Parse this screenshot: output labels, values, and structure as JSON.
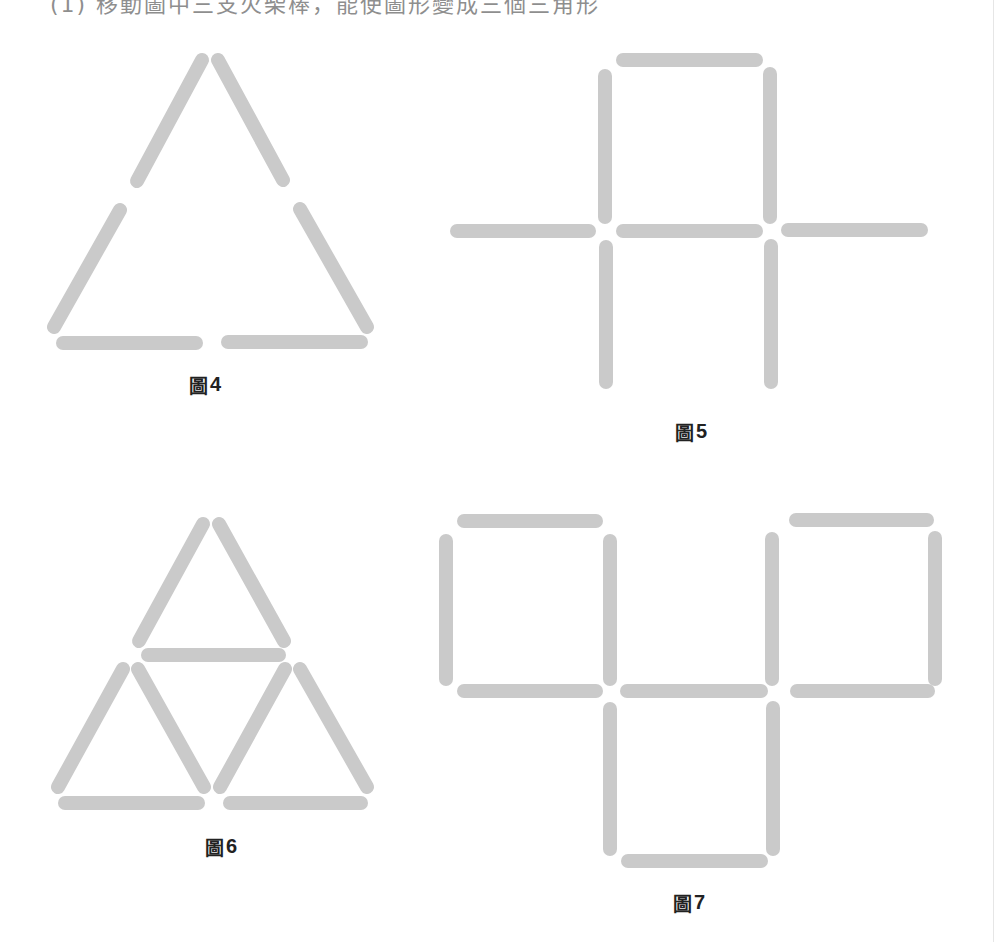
{
  "instruction": {
    "text": "(1) 移動圖中三支火柴棒，能使圖形變成三個三角形"
  },
  "style": {
    "stick_color": "#cacaca",
    "label_color": "#222222"
  },
  "figures": [
    {
      "id": "fig4",
      "label_char": "圖",
      "label_num": "4",
      "shape": "large triangle made of 6 matchsticks"
    },
    {
      "id": "fig5",
      "label_char": "圖",
      "label_num": "5",
      "shape": "cross / house shape made of 8 matchsticks"
    },
    {
      "id": "fig6",
      "label_char": "圖",
      "label_num": "6",
      "shape": "triangle subdivided into 3 small triangles, 9 matchsticks"
    },
    {
      "id": "fig7",
      "label_char": "圖",
      "label_num": "7",
      "shape": "three squares arrangement, 12 matchsticks"
    }
  ]
}
